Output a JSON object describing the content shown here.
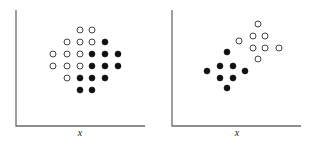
{
  "chart_data": [
    {
      "type": "scatter",
      "title": "",
      "xlabel": "x",
      "ylabel": "",
      "grid": false,
      "legend": null,
      "axes_px": {
        "x0": 16,
        "y0": 126,
        "x1": 145,
        "y1": 10
      },
      "series": [
        {
          "name": "open",
          "marker": "open-circle",
          "points": [
            [
              80,
              30
            ],
            [
              92,
              30
            ],
            [
              67,
              42
            ],
            [
              80,
              42
            ],
            [
              92,
              42
            ],
            [
              53,
              54
            ],
            [
              67,
              54
            ],
            [
              80,
              54
            ],
            [
              53,
              66
            ],
            [
              67,
              66
            ],
            [
              80,
              66
            ],
            [
              67,
              78
            ]
          ]
        },
        {
          "name": "filled",
          "marker": "filled-circle",
          "points": [
            [
              105,
              42
            ],
            [
              92,
              54
            ],
            [
              105,
              54
            ],
            [
              118,
              54
            ],
            [
              92,
              66
            ],
            [
              105,
              66
            ],
            [
              118,
              66
            ],
            [
              80,
              78
            ],
            [
              92,
              78
            ],
            [
              105,
              78
            ],
            [
              80,
              90
            ],
            [
              92,
              90
            ]
          ]
        }
      ]
    },
    {
      "type": "scatter",
      "title": "",
      "xlabel": "x",
      "ylabel": "",
      "grid": false,
      "legend": null,
      "axes_px": {
        "x0": 172,
        "y0": 126,
        "x1": 301,
        "y1": 10
      },
      "series": [
        {
          "name": "open",
          "marker": "open-circle",
          "points": [
            [
              258,
              24
            ],
            [
              253,
              36
            ],
            [
              265,
              36
            ],
            [
              239,
              41
            ],
            [
              253,
              48
            ],
            [
              265,
              48
            ],
            [
              279,
              48
            ],
            [
              258,
              59
            ]
          ]
        },
        {
          "name": "filled",
          "marker": "filled-circle",
          "points": [
            [
              227,
              52
            ],
            [
              220,
              66
            ],
            [
              233,
              66
            ],
            [
              207,
              71
            ],
            [
              245,
              71
            ],
            [
              220,
              78
            ],
            [
              233,
              78
            ],
            [
              227,
              88
            ]
          ]
        }
      ]
    }
  ],
  "labels": {
    "left_xlabel": "x",
    "right_xlabel": "x"
  },
  "colors": {
    "axis": "#6a6a6a",
    "filled": "#111111",
    "open_stroke": "#444444"
  }
}
